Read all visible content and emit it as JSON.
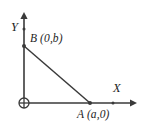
{
  "figure": {
    "background_color": "#ffffff",
    "stroke_color": "#3a3a3a",
    "text_color": "#1d1d1d"
  },
  "axes": {
    "x": {
      "name": "X",
      "origin_px": [
        24,
        103
      ],
      "end_px": [
        136,
        103
      ],
      "has_arrowhead": true,
      "tick_px": [
        113,
        103
      ]
    },
    "y": {
      "name": "Y",
      "origin_px": [
        24,
        103
      ],
      "end_px": [
        24,
        13
      ],
      "has_arrowhead": true,
      "tick_px": [
        24,
        29
      ]
    }
  },
  "origin": {
    "symbol": "circled-plus",
    "glyph": "⊕",
    "position_px": [
      24,
      103
    ]
  },
  "points": [
    {
      "id": "B",
      "name": "B",
      "label": "B (0,b)",
      "coordinates": "(0,b)",
      "x_value": "0",
      "y_value": "b",
      "position_px": [
        24,
        46
      ]
    },
    {
      "id": "A",
      "name": "A",
      "label": "A (a,0)",
      "coordinates": "(a,0)",
      "x_value": "a",
      "y_value": "0",
      "position_px": [
        90,
        103
      ]
    }
  ],
  "segments": [
    {
      "name": "hypotenuse-AB",
      "from": "B",
      "to": "A",
      "from_px": [
        24,
        46
      ],
      "to_px": [
        90,
        103
      ]
    },
    {
      "name": "leg-OB",
      "from": "origin",
      "to": "B",
      "from_px": [
        24,
        103
      ],
      "to_px": [
        24,
        46
      ]
    },
    {
      "name": "leg-OA",
      "from": "origin",
      "to": "A",
      "from_px": [
        24,
        103
      ],
      "to_px": [
        90,
        103
      ]
    }
  ]
}
